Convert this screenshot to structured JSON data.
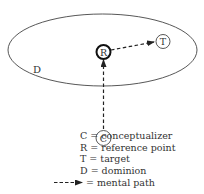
{
  "diagram": {
    "dominion_label": "D",
    "nodes": {
      "reference_point": "R",
      "target": "T",
      "conceptualizer": "C"
    }
  },
  "legend": [
    {
      "symbol": "C",
      "eq": "=",
      "meaning": "conceptualizer"
    },
    {
      "symbol": "R",
      "eq": "=",
      "meaning": "reference point"
    },
    {
      "symbol": "T",
      "eq": "=",
      "meaning": "target"
    },
    {
      "symbol": "D",
      "eq": "=",
      "meaning": "dominion"
    },
    {
      "symbol": "dashed-arrow",
      "eq": "=",
      "meaning": "mental path"
    }
  ],
  "legend_text": {
    "c": "C = conceptualizer",
    "r": "R = reference point",
    "t": "T = target",
    "d": "D = dominion",
    "path": "= mental path"
  },
  "colors": {
    "line": "#333333",
    "background": "#ffffff"
  }
}
